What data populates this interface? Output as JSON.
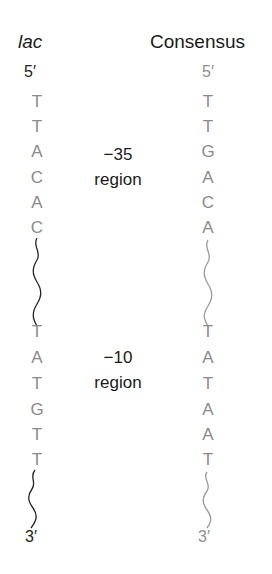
{
  "headers": {
    "lac": "lac",
    "consensus": "Consensus"
  },
  "ends": {
    "lac_5": "5′",
    "lac_3": "3′",
    "cons_5": "5′",
    "cons_3": "3′"
  },
  "regions": [
    {
      "position": "−35",
      "label": "region"
    },
    {
      "position": "−10",
      "label": "region"
    }
  ],
  "lac": {
    "minus35": [
      "T",
      "T",
      "A",
      "C",
      "A",
      "C"
    ],
    "minus10": [
      "T",
      "A",
      "T",
      "G",
      "T",
      "T"
    ]
  },
  "consensus": {
    "minus35": [
      "T",
      "T",
      "G",
      "A",
      "C",
      "A"
    ],
    "minus10": [
      "T",
      "A",
      "T",
      "A",
      "A",
      "T"
    ]
  },
  "colors": {
    "heading": "#1a1a1a",
    "base": "#8a8a8a",
    "lac_wave": "#222222",
    "consensus_wave": "#9a9a9a"
  }
}
